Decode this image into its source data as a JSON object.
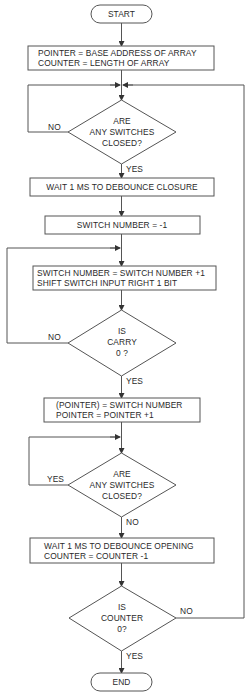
{
  "flowchart": {
    "start": {
      "label": "START"
    },
    "init": {
      "line1": "POINTER = BASE ADDRESS OF ARRAY",
      "line2": "COUNTER = LENGTH OF ARRAY"
    },
    "decision_closed": {
      "line1": "ARE",
      "line2": "ANY SWITCHES",
      "line3": "CLOSED?",
      "no_label": "NO",
      "yes_label": "YES"
    },
    "debounce_closure": {
      "label": "WAIT 1 MS TO DEBOUNCE CLOSURE"
    },
    "switch_init": {
      "label": "SWITCH NUMBER = -1"
    },
    "shift": {
      "line1": "SWITCH NUMBER = SWITCH NUMBER +1",
      "line2": "SHIFT SWITCH INPUT RIGHT 1 BIT"
    },
    "decision_carry": {
      "line1": "IS",
      "line2": "CARRY",
      "line3": "0 ?",
      "no_label": "NO",
      "yes_label": "YES"
    },
    "store": {
      "line1": "(POINTER) = SWITCH NUMBER",
      "line2": "POINTER = POINTER +1"
    },
    "decision_open": {
      "line1": "ARE",
      "line2": "ANY SWITCHES",
      "line3": "CLOSED?",
      "yes_label": "YES",
      "no_label": "NO"
    },
    "debounce_opening": {
      "line1": "WAIT 1 MS TO DEBOUNCE OPENING",
      "line2": "COUNTER = COUNTER -1"
    },
    "decision_counter": {
      "line1": "IS",
      "line2": "COUNTER",
      "line3": "0?",
      "no_label": "NO",
      "yes_label": "YES"
    },
    "end": {
      "label": "END"
    }
  }
}
